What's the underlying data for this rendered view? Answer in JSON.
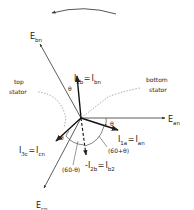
{
  "diagram": {
    "rotation_arrow": {
      "direction": "counter-clockwise"
    },
    "vectors": {
      "E_an": {
        "main": "E",
        "sub": "an"
      },
      "E_bn": {
        "main": "E",
        "sub": "bn"
      },
      "E_cn": {
        "main": "E",
        "sub": "cn"
      },
      "I_2b": {
        "lhs_main": "I",
        "lhs_sub": "2b",
        "eq": "=",
        "rhs_main": "I",
        "rhs_sub": "bn"
      },
      "I_1a": {
        "lhs_main": "I",
        "lhs_sub": "1a",
        "eq": "=",
        "rhs_main": "I",
        "rhs_sub": "an"
      },
      "I_3c": {
        "lhs_main": "I",
        "lhs_sub": "3c",
        "eq": "=",
        "rhs_main": "I",
        "rhs_sub": "cn"
      },
      "neg_I_2b": {
        "lhs_main": "-I",
        "lhs_sub": "2b",
        "eq": "=",
        "rhs_main": "I",
        "rhs_sub": "b2"
      }
    },
    "labels": {
      "top_stator_1": "top",
      "top_stator_2": "stator",
      "bottom_stator_1": "bottom",
      "bottom_stator_2": "stator"
    },
    "angles": {
      "theta": "θ",
      "sixty_plus": "(60+θ)",
      "sixty_minus": "(60-θ)"
    },
    "colors": {
      "ink": "#222222",
      "dotted": "#888888",
      "arrow_arc": "#555555"
    }
  }
}
